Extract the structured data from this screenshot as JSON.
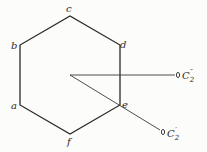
{
  "diagram": {
    "vertices": {
      "a": {
        "label": "a",
        "x": 20,
        "y": 105
      },
      "b": {
        "label": "b",
        "x": 20,
        "y": 45
      },
      "c": {
        "label": "c",
        "x": 70,
        "y": 16
      },
      "d": {
        "label": "d",
        "x": 120,
        "y": 45
      },
      "e": {
        "label": "e",
        "x": 120,
        "y": 105
      },
      "f": {
        "label": "f",
        "x": 70,
        "y": 134
      }
    },
    "center": {
      "x": 70,
      "y": 75
    },
    "axes": [
      {
        "label": "C",
        "subscript": "2",
        "prime": "″",
        "end_x": 177,
        "end_y": 75
      },
      {
        "label": "C",
        "subscript": "2",
        "prime": "′",
        "end_x": 162,
        "end_y": 132
      }
    ],
    "stroke_color": "#2a2a2a"
  }
}
